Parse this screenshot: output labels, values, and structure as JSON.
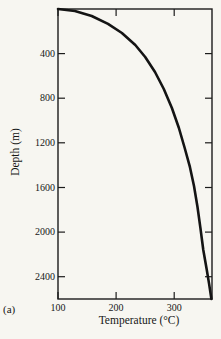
{
  "figure": {
    "part_label": "(a)",
    "xlabel": "Temperature (°C)",
    "ylabel": "Depth (m)"
  },
  "chart_data": {
    "type": "line",
    "title": "",
    "xlabel": "Temperature (°C)",
    "ylabel": "Depth (m)",
    "xlim": [
      100,
      365
    ],
    "ylim": [
      0,
      2600
    ],
    "x_ticks": [
      100,
      200,
      300
    ],
    "y_ticks": [
      400,
      800,
      1200,
      1600,
      2000,
      2400
    ],
    "y_axis_direction": "down",
    "grid": false,
    "legend": "none",
    "frame": "box-with-inward-ticks",
    "series": [
      {
        "name": "geotherm",
        "points": [
          [
            100,
            0
          ],
          [
            129,
            18
          ],
          [
            158,
            63
          ],
          [
            186,
            134
          ],
          [
            210,
            215
          ],
          [
            233,
            323
          ],
          [
            250,
            430
          ],
          [
            267,
            565
          ],
          [
            282,
            717
          ],
          [
            296,
            888
          ],
          [
            308,
            1067
          ],
          [
            318,
            1246
          ],
          [
            327,
            1416
          ],
          [
            334,
            1587
          ],
          [
            340,
            1775
          ],
          [
            345,
            1963
          ],
          [
            350,
            2161
          ],
          [
            356,
            2340
          ],
          [
            360,
            2465
          ],
          [
            364,
            2600
          ]
        ]
      }
    ],
    "colors": {
      "line": "#141414",
      "axis": "#1c1c1c",
      "background": "#f7f6f1"
    }
  }
}
